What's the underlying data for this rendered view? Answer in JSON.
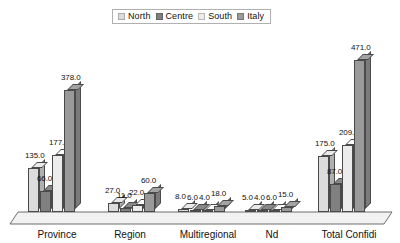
{
  "chart_data": {
    "type": "bar",
    "title": "",
    "subtitle": "",
    "xlabel": "",
    "ylabel": "",
    "grid": false,
    "legend_position": "top-center",
    "style": "3d-clustered-column",
    "ylim": [
      0,
      471
    ],
    "categories": [
      "Province",
      "Region",
      "Multiregional",
      "Nd",
      "Total Confidi"
    ],
    "series": [
      {
        "name": "North",
        "color": "#dcdcdc",
        "values": [
          135.0,
          27.0,
          8.0,
          5.0,
          175.0
        ]
      },
      {
        "name": "Centre",
        "color": "#808080",
        "values": [
          66.0,
          11.0,
          6.0,
          4.0,
          87.0
        ]
      },
      {
        "name": "South",
        "color": "#ececec",
        "values": [
          177.0,
          22.0,
          4.0,
          6.0,
          209.0
        ]
      },
      {
        "name": "Italy",
        "color": "#9a9a9a",
        "values": [
          378.0,
          60.0,
          18.0,
          15.0,
          471.0
        ]
      }
    ],
    "value_labels": [
      [
        "135.0",
        "66.0",
        "177.0",
        "378.0"
      ],
      [
        "27.0",
        "11.0",
        "22.0",
        "60.0"
      ],
      [
        "8.0",
        "6.0",
        "4.0",
        "18.0"
      ],
      [
        "5.0",
        "4.0",
        "6.0",
        "15.0"
      ],
      [
        "175.0",
        "87.0",
        "209.0",
        "471.0"
      ]
    ]
  },
  "legend": {
    "items": [
      {
        "label": "North"
      },
      {
        "label": "Centre"
      },
      {
        "label": "South"
      },
      {
        "label": "Italy"
      }
    ]
  },
  "axis": {
    "categories": [
      {
        "label": "Province"
      },
      {
        "label": "Region"
      },
      {
        "label": "Multiregional"
      },
      {
        "label": "Nd"
      },
      {
        "label": "Total Confidi"
      }
    ]
  },
  "colors": {
    "north": "#dcdcdc",
    "centre": "#808080",
    "south": "#ececec",
    "italy": "#9a9a9a",
    "outline": "#4a4a4a",
    "floor": "#f2f2f2",
    "text": "#111111"
  }
}
